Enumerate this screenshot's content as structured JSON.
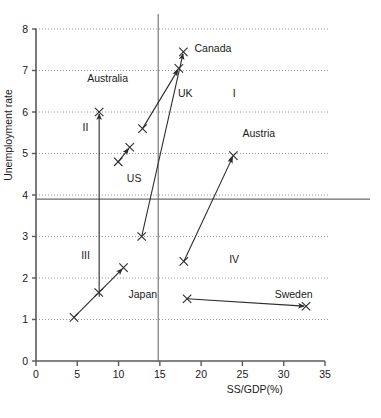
{
  "chart_data": {
    "type": "scatter",
    "title": "",
    "xlabel": "SS/GDP(%)",
    "ylabel": "Unemployment rate",
    "xlim": [
      0,
      35
    ],
    "ylim": [
      0,
      8
    ],
    "xticks": [
      "0",
      "5",
      "10",
      "15",
      "20",
      "25",
      "30",
      "35"
    ],
    "yticks": [
      "0",
      "1",
      "2",
      "3",
      "4",
      "5",
      "6",
      "7",
      "8"
    ],
    "grid": "horizontal-dotted",
    "legend": "none",
    "reference_lines": {
      "vertical_x": 14.8,
      "horizontal_y": 3.9
    },
    "quadrant_labels": [
      {
        "text": "I",
        "x": 24.0,
        "y": 6.35
      },
      {
        "text": "II",
        "x": 6.0,
        "y": 5.55
      },
      {
        "text": "III",
        "x": 6.0,
        "y": 2.45
      },
      {
        "text": "IV",
        "x": 24.0,
        "y": 2.35
      }
    ],
    "series": [
      {
        "name": "Australia",
        "label_x": 6.2,
        "label_y": 6.72,
        "points": [
          {
            "x": 7.65,
            "y": 1.55,
            "marker": "none"
          },
          {
            "x": 7.65,
            "y": 6.0,
            "marker": "x"
          }
        ],
        "arrow": "end"
      },
      {
        "name": "Japan",
        "label_x": 11.2,
        "label_y": 1.52,
        "points": [
          {
            "x": 4.6,
            "y": 1.05,
            "marker": "x"
          },
          {
            "x": 7.6,
            "y": 1.65,
            "marker": "x"
          },
          {
            "x": 10.6,
            "y": 2.25,
            "marker": "x"
          }
        ],
        "arrow": "end"
      },
      {
        "name": "US",
        "label_x": 11.0,
        "label_y": 4.32,
        "points": [
          {
            "x": 9.95,
            "y": 4.8,
            "marker": "x"
          },
          {
            "x": 11.35,
            "y": 5.15,
            "marker": "x"
          }
        ],
        "arrow": "end"
      },
      {
        "name": "UK",
        "label_x": 17.2,
        "label_y": 6.35,
        "points": [
          {
            "x": 12.9,
            "y": 5.6,
            "marker": "x"
          },
          {
            "x": 17.3,
            "y": 7.05,
            "marker": "x"
          }
        ],
        "arrow": "end"
      },
      {
        "name": "Canada",
        "label_x": 19.2,
        "label_y": 7.45,
        "points": [
          {
            "x": 12.8,
            "y": 3.0,
            "marker": "x"
          },
          {
            "x": 17.85,
            "y": 7.45,
            "marker": "x"
          }
        ],
        "arrow": "end"
      },
      {
        "name": "Austria",
        "label_x": 25.0,
        "label_y": 5.4,
        "points": [
          {
            "x": 17.9,
            "y": 2.4,
            "marker": "x"
          },
          {
            "x": 23.9,
            "y": 4.95,
            "marker": "x"
          }
        ],
        "arrow": "end"
      },
      {
        "name": "Sweden",
        "label_x": 33.5,
        "label_y": 1.52,
        "points": [
          {
            "x": 18.3,
            "y": 1.5,
            "marker": "x"
          },
          {
            "x": 32.7,
            "y": 1.32,
            "marker": "x"
          }
        ],
        "arrow": "end"
      }
    ],
    "colors": {
      "axis": "#5a5a5a",
      "grid": "#9a9a9a",
      "line": "#2b2b2b",
      "text": "#1a1a1a"
    }
  }
}
